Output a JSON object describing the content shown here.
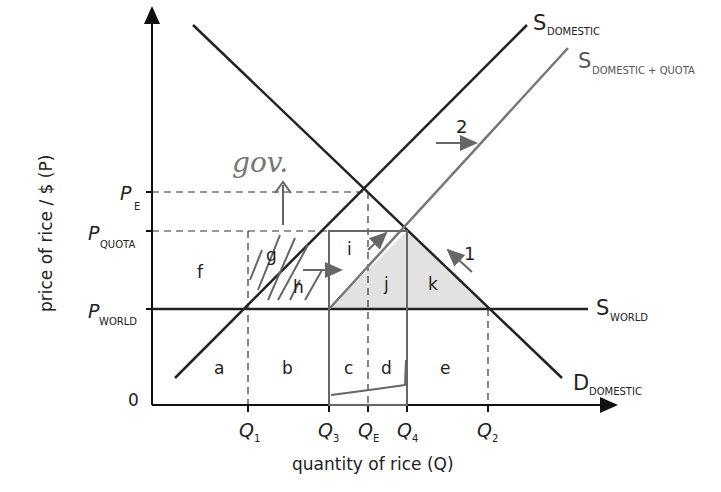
{
  "diagram": {
    "y_axis_label": "price of rice / $ (P)",
    "x_axis_label": "quantity of rice (Q)",
    "origin_label": "0",
    "price_levels": [
      {
        "id": "pe",
        "main": "P",
        "sub": "E"
      },
      {
        "id": "pquota",
        "main": "P",
        "sub": "QUOTA"
      },
      {
        "id": "pworld",
        "main": "P",
        "sub": "WORLD"
      }
    ],
    "quantity_levels": [
      {
        "id": "q1",
        "main": "Q",
        "sub": "1"
      },
      {
        "id": "q3",
        "main": "Q",
        "sub": "3"
      },
      {
        "id": "qe",
        "main": "Q",
        "sub": "E"
      },
      {
        "id": "q4",
        "main": "Q",
        "sub": "4"
      },
      {
        "id": "q2",
        "main": "Q",
        "sub": "2"
      }
    ],
    "curves": {
      "s_domestic": {
        "main": "S",
        "sub": "DOMESTIC"
      },
      "s_domestic_quota": {
        "main": "S",
        "sub": "DOMESTIC + QUOTA"
      },
      "s_world": {
        "main": "S",
        "sub": "WORLD"
      },
      "d_domestic": {
        "main": "D",
        "sub": "DOMESTIC"
      }
    },
    "areas": [
      "a",
      "b",
      "c",
      "d",
      "e",
      "f",
      "g",
      "h",
      "i",
      "j",
      "k"
    ],
    "arrow_labels": {
      "one": "1",
      "two": "2"
    },
    "handwritten": {
      "gov": "gov."
    },
    "colors": {
      "axis": "#1a1a1a",
      "quota_supply": "#777777",
      "shade": "#e2e2e2",
      "pen": "#666666"
    }
  }
}
